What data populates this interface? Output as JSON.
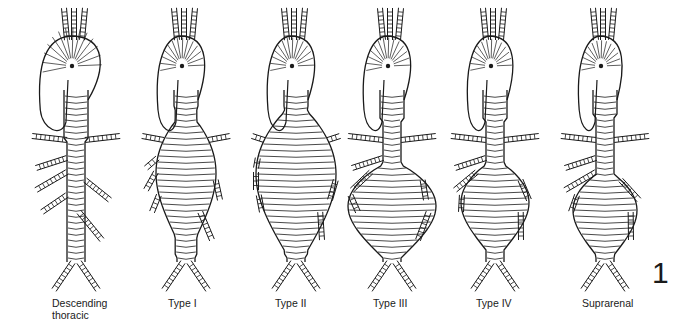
{
  "figure": {
    "number": "1",
    "panels": [
      {
        "id": "descending-thoracic",
        "label_line1": "Descending",
        "label_line2": "thoracic",
        "cx": 76,
        "label_x": 52,
        "arch_bulge": 1.35,
        "neck_top": 140,
        "neck_width": 20,
        "belly_top": 150,
        "belly_bottom": 150,
        "belly_width": 20
      },
      {
        "id": "type-i",
        "label_line1": "Type I",
        "label_line2": "",
        "cx": 186,
        "label_x": 168,
        "arch_bulge": 1.0,
        "neck_top": 110,
        "neck_width": 36,
        "belly_top": 120,
        "belly_bottom": 240,
        "belly_width": 30
      },
      {
        "id": "type-ii",
        "label_line1": "Type II",
        "label_line2": "",
        "cx": 296,
        "label_x": 275,
        "arch_bulge": 1.0,
        "neck_top": 110,
        "neck_width": 38,
        "belly_top": 110,
        "belly_bottom": 255,
        "belly_width": 40
      },
      {
        "id": "type-iii",
        "label_line1": "Type III",
        "label_line2": "",
        "cx": 392,
        "label_x": 373,
        "arch_bulge": 1.0,
        "neck_top": 120,
        "neck_width": 24,
        "belly_top": 165,
        "belly_bottom": 258,
        "belly_width": 44
      },
      {
        "id": "type-iv",
        "label_line1": "Type IV",
        "label_line2": "",
        "cx": 495,
        "label_x": 476,
        "arch_bulge": 0.95,
        "neck_top": 120,
        "neck_width": 14,
        "belly_top": 165,
        "belly_bottom": 250,
        "belly_width": 34
      },
      {
        "id": "suprarenal",
        "label_line1": "Suprarenal",
        "label_line2": "",
        "cx": 605,
        "label_x": 582,
        "arch_bulge": 0.9,
        "neck_top": 118,
        "neck_width": 10,
        "belly_top": 175,
        "belly_bottom": 255,
        "belly_width": 32
      }
    ]
  },
  "colors": {
    "ink": "#1a1a1a",
    "background": "#ffffff"
  }
}
